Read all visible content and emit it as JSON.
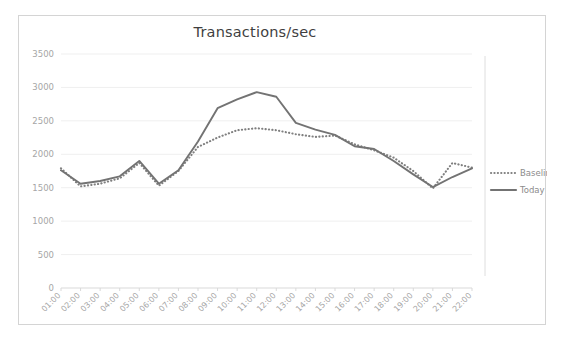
{
  "chart_data": {
    "type": "line",
    "title": "Transactions/sec",
    "xlabel": "",
    "ylabel": "",
    "ylim": [
      0,
      3500
    ],
    "ytick_step": 500,
    "yticks": [
      "0",
      "500",
      "1000",
      "1500",
      "2000",
      "2500",
      "3000",
      "3500"
    ],
    "grid": true,
    "legend_position": "right",
    "categories": [
      "01:00",
      "02:00",
      "03:00",
      "04:00",
      "05:00",
      "06:00",
      "07:00",
      "08:00",
      "09:00",
      "10:00",
      "11:00",
      "12:00",
      "13:00",
      "14:00",
      "15:00",
      "16:00",
      "17:00",
      "18:00",
      "19:00",
      "20:00",
      "21:00",
      "22:00"
    ],
    "series": [
      {
        "name": "Baseline",
        "style": "dotted",
        "color": "#808080",
        "values": [
          1790,
          1520,
          1560,
          1640,
          1870,
          1530,
          1750,
          2110,
          2250,
          2360,
          2390,
          2360,
          2300,
          2260,
          2280,
          2150,
          2060,
          1950,
          1750,
          1490,
          1870,
          1800
        ]
      },
      {
        "name": "Today",
        "style": "solid",
        "color": "#737373",
        "values": [
          1760,
          1560,
          1600,
          1670,
          1900,
          1560,
          1760,
          2190,
          2690,
          2820,
          2930,
          2860,
          2470,
          2370,
          2290,
          2120,
          2080,
          1900,
          1700,
          1510,
          1660,
          1790
        ]
      }
    ]
  },
  "legend": {
    "items": [
      {
        "label": "Baseline",
        "marker": "dotted-line-swatch"
      },
      {
        "label": "Today",
        "marker": "solid-line-swatch"
      }
    ]
  },
  "colors": {
    "grid": "#efefef",
    "axis": "#d9d9d9",
    "tick_text": "#a6a6a6",
    "title_text": "#3f3f3f",
    "legend_text": "#8c8c8c",
    "border": "#d4d4d4",
    "background": "#ffffff"
  }
}
